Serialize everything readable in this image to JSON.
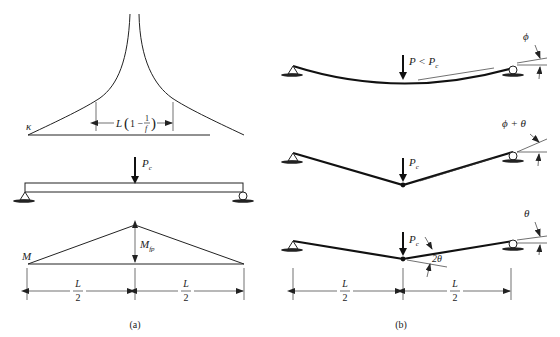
{
  "panel_a": {
    "caption": "(a)",
    "curvature": {
      "label": "κ",
      "span_label_L": "L",
      "span_label_open": "(",
      "span_label_one_minus": "1 −",
      "span_label_num": "1",
      "span_label_den": "f",
      "span_label_close": ")"
    },
    "beam": {
      "load_label": "P",
      "load_sub": "c"
    },
    "moment": {
      "label": "M",
      "peak_label": "M",
      "peak_sub": "fp"
    },
    "dims": [
      {
        "num": "L",
        "den": "2"
      },
      {
        "num": "L",
        "den": "2"
      }
    ]
  },
  "panel_b": {
    "caption": "(b)",
    "case1": {
      "load_label": "P < P",
      "load_sub": "c",
      "angle_label": "ϕ"
    },
    "case2": {
      "load_label": "P",
      "load_sub": "c",
      "angle_label": "ϕ + θ"
    },
    "case3": {
      "load_label": "P",
      "load_sub": "c",
      "angle_label": "θ",
      "hinge_angle_label": "2θ"
    },
    "dims": [
      {
        "num": "L",
        "den": "2"
      },
      {
        "num": "L",
        "den": "2"
      }
    ]
  }
}
